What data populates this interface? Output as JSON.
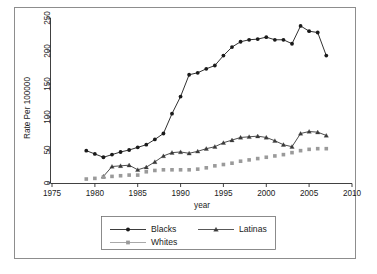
{
  "chart_data": {
    "type": "line",
    "title": "",
    "xlabel": "year",
    "ylabel": "Rate Per 100000",
    "xlim": [
      1975,
      2010
    ],
    "ylim": [
      0,
      250
    ],
    "xticks": [
      1975,
      1980,
      1985,
      1990,
      1995,
      2000,
      2005,
      2010
    ],
    "yticks": [
      0,
      50,
      100,
      150,
      200,
      250
    ],
    "grid": false,
    "legend_position": "bottom-center",
    "x": [
      1979,
      1980,
      1981,
      1982,
      1983,
      1984,
      1985,
      1986,
      1987,
      1988,
      1989,
      1990,
      1991,
      1992,
      1993,
      1994,
      1995,
      1996,
      1997,
      1998,
      1999,
      2000,
      2001,
      2002,
      2003,
      2004,
      2005,
      2006,
      2007
    ],
    "series": [
      {
        "name": "Blacks",
        "color": "#1a1a1a",
        "marker": "circle",
        "values": [
          49,
          44,
          39,
          43,
          47,
          50,
          54,
          58,
          66,
          75,
          105,
          131,
          164,
          167,
          173,
          178,
          193,
          206,
          214,
          217,
          218,
          221,
          217,
          217,
          211,
          238,
          230,
          228,
          193
        ]
      },
      {
        "name": "Latinas",
        "color": "#3a3a3a",
        "marker": "triangle",
        "values": [
          null,
          null,
          10,
          25,
          26,
          27,
          20,
          24,
          32,
          41,
          46,
          47,
          45,
          48,
          52,
          55,
          61,
          65,
          69,
          70,
          71,
          69,
          64,
          58,
          55,
          75,
          78,
          77,
          72
        ]
      },
      {
        "name": "Whites",
        "color": "#9a9a9a",
        "marker": "square",
        "values": [
          6,
          7,
          9,
          10,
          11,
          12,
          12,
          17,
          19,
          20,
          20,
          20,
          20,
          21,
          23,
          26,
          28,
          30,
          33,
          35,
          37,
          39,
          41,
          43,
          46,
          49,
          51,
          52,
          52
        ]
      }
    ]
  },
  "axes": {
    "y_title": "Rate Per 100000",
    "x_title": "year",
    "y_tick_labels": [
      "0",
      "50",
      "100",
      "150",
      "200",
      "250"
    ],
    "x_tick_labels": [
      "1975",
      "1980",
      "1985",
      "1990",
      "1995",
      "2000",
      "2005",
      "2010"
    ]
  },
  "legend": {
    "entries": [
      {
        "label": "Blacks",
        "marker": "circle-filled-black"
      },
      {
        "label": "Latinas",
        "marker": "triangle-filled-dark"
      },
      {
        "label": "Whites",
        "marker": "square-filled-gray"
      }
    ]
  }
}
